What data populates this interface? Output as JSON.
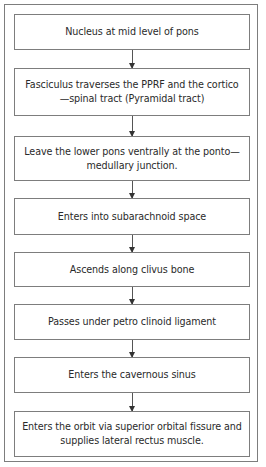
{
  "diagram": {
    "type": "flowchart",
    "direction": "top-to-bottom",
    "steps": [
      {
        "label": "Nucleus at mid level of pons"
      },
      {
        "label": "Fasciculus traverses the PPRF and the cortico—spinal tract (Pyramidal tract)"
      },
      {
        "label": "Leave the lower pons ventrally at the ponto—medullary  junction."
      },
      {
        "label": "Enters into subarachnoid space"
      },
      {
        "label": "Ascends along clivus bone"
      },
      {
        "label": "Passes under petro clinoid ligament"
      },
      {
        "label": "Enters the cavernous sinus"
      },
      {
        "label": "Enters the orbit via superior orbital fissure and supplies lateral rectus muscle."
      }
    ]
  },
  "colors": {
    "border": "#7d7d7d",
    "text": "#2a2a2a",
    "arrow": "#333333",
    "background": "#ffffff"
  }
}
